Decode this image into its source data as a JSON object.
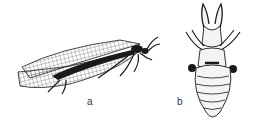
{
  "figure": {
    "panels": [
      {
        "id": "a",
        "label": "a",
        "subject": "adult-winged-insect"
      },
      {
        "id": "b",
        "label": "b",
        "subject": "larva"
      }
    ],
    "colors": {
      "ink": "#1a1a1a",
      "background": "#ffffff",
      "label": "#333333"
    }
  }
}
